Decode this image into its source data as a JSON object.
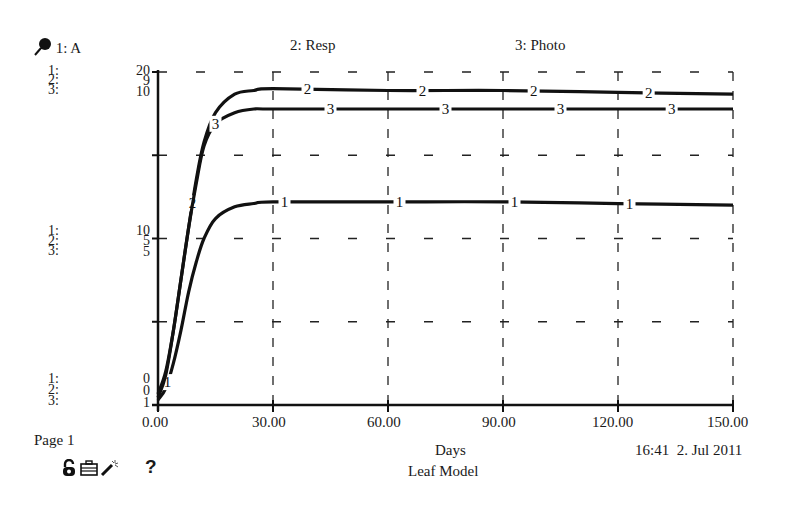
{
  "header": {
    "pin_icon": "pin-icon",
    "legend": [
      {
        "label": "1: A"
      },
      {
        "label": "2: Resp"
      },
      {
        "label": "3: Photo"
      }
    ]
  },
  "y_axis": {
    "series_keys": [
      "1:",
      "2:",
      "3:"
    ],
    "top": [
      "20",
      "9",
      "10"
    ],
    "mid": [
      "10",
      "5",
      "5"
    ],
    "bottom": [
      "0",
      "0",
      "1"
    ]
  },
  "x_axis": {
    "ticks": [
      "0.00",
      "30.00",
      "60.00",
      "90.00",
      "120.00",
      "150.00"
    ],
    "label": "Days"
  },
  "footer": {
    "page": "Page 1",
    "timestamp": "16:41  2. Jul 2011",
    "model_name": "Leaf Model",
    "icons": [
      "lock-open-icon",
      "toolbox-icon",
      "magic-wand-icon",
      "help-icon"
    ],
    "help_glyph": "?"
  },
  "chart_data": {
    "type": "line",
    "title": "",
    "xlabel": "Days",
    "ylabel": "",
    "x_range": [
      0,
      150
    ],
    "x_ticks": [
      0,
      30,
      60,
      90,
      120,
      150
    ],
    "grid": true,
    "legend_position": "top",
    "subtitle": "Leaf Model",
    "series": [
      {
        "name": "1: A",
        "ylim": [
          0,
          20
        ],
        "x": [
          0,
          2,
          4,
          6,
          8,
          10,
          12,
          15,
          20,
          25,
          30,
          60,
          90,
          120,
          150
        ],
        "values": [
          0.3,
          1.0,
          2.5,
          4.5,
          6.8,
          8.6,
          10.0,
          11.2,
          11.9,
          12.1,
          12.2,
          12.2,
          12.2,
          12.1,
          12.0
        ]
      },
      {
        "name": "2: Resp",
        "ylim": [
          0,
          9
        ],
        "x": [
          0,
          2,
          4,
          6,
          8,
          10,
          12,
          15,
          20,
          25,
          30,
          60,
          90,
          120,
          150
        ],
        "values": [
          0.2,
          0.8,
          2.0,
          3.4,
          4.8,
          6.1,
          7.1,
          7.9,
          8.4,
          8.5,
          8.55,
          8.5,
          8.5,
          8.45,
          8.4
        ]
      },
      {
        "name": "3: Photo",
        "ylim": [
          1,
          10
        ],
        "x": [
          0,
          2,
          4,
          6,
          8,
          10,
          12,
          15,
          20,
          25,
          30,
          60,
          90,
          120,
          150
        ],
        "values": [
          1.3,
          1.9,
          3.0,
          4.4,
          5.8,
          7.0,
          8.0,
          8.6,
          8.9,
          9.0,
          9.0,
          9.0,
          9.0,
          9.0,
          9.0
        ]
      }
    ],
    "series_label_positions_days": {
      "1": [
        2.5,
        33,
        63,
        93,
        123
      ],
      "2": [
        9,
        39,
        69,
        98,
        128
      ],
      "3": [
        15,
        45,
        75,
        105,
        134
      ]
    },
    "timestamp": "16:41  2. Jul 2011",
    "page": "Page 1"
  }
}
